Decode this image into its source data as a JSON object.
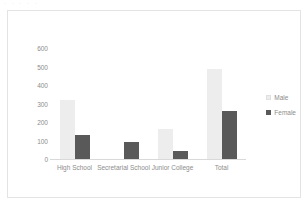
{
  "top_artifact_text": "·  · · · ·",
  "chart_data": {
    "type": "bar",
    "title": "",
    "subtitle": "",
    "xlabel": "",
    "ylabel": "",
    "categories": [
      "High School",
      "Secretarial School",
      "Junior College",
      "Total"
    ],
    "series": [
      {
        "name": "Male",
        "color": "#ededed",
        "values": [
          320,
          0,
          160,
          485
        ]
      },
      {
        "name": "Female",
        "color": "#595959",
        "values": [
          128,
          90,
          45,
          258
        ]
      }
    ],
    "ylim": [
      0,
      650
    ],
    "yticks": [
      0,
      100,
      200,
      300,
      400,
      500,
      600
    ],
    "ytick_labels": [
      "0",
      "100",
      "200",
      "300",
      "400",
      "500",
      "600"
    ],
    "grid": false,
    "legend_position": "right",
    "legend_entries": [
      "Male",
      "Female"
    ],
    "axis_color": "#d9d9d9",
    "text_color": "#8c8c8c",
    "background": "#ffffff",
    "border_color": "#e3e3e3"
  }
}
